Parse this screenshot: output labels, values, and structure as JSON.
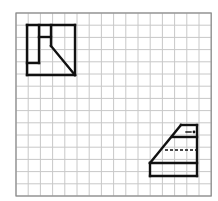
{
  "canvas": {
    "width": 218,
    "height": 201,
    "background": "#ffffff"
  },
  "grid": {
    "x0": 16,
    "y0": 13,
    "cols": 16,
    "rows": 15,
    "cell": 12.2,
    "line_color": "#c8c8c8",
    "border_color": "#8a8a8a"
  },
  "figures": [
    {
      "name": "top-left-figure",
      "stroke": "#111111",
      "stroke_width": 2.4,
      "lines": [
        [
          27,
          25,
          75,
          25
        ],
        [
          75,
          25,
          75,
          75
        ],
        [
          75,
          75,
          27,
          75
        ],
        [
          27,
          75,
          27,
          25
        ],
        [
          39,
          25,
          39,
          63
        ],
        [
          27,
          63,
          39,
          63
        ],
        [
          51,
          25,
          51,
          46
        ],
        [
          39,
          37,
          51,
          37
        ],
        [
          51,
          46,
          75,
          75
        ]
      ]
    },
    {
      "name": "bottom-right-figure",
      "stroke": "#111111",
      "stroke_width": 2.4,
      "lines": [
        [
          150,
          163,
          197,
          163
        ],
        [
          150,
          176,
          197,
          176
        ],
        [
          150,
          163,
          150,
          176
        ],
        [
          197,
          125,
          197,
          176
        ],
        [
          181,
          125,
          197,
          125
        ],
        [
          150,
          163,
          181,
          125
        ],
        [
          172,
          137,
          197,
          137
        ]
      ],
      "dashed": [
        [
          165,
          150,
          197,
          150
        ]
      ],
      "marks": {
        "dash": [
          186,
          132,
          191,
          132
        ],
        "dot": [
          194,
          132
        ]
      }
    }
  ]
}
